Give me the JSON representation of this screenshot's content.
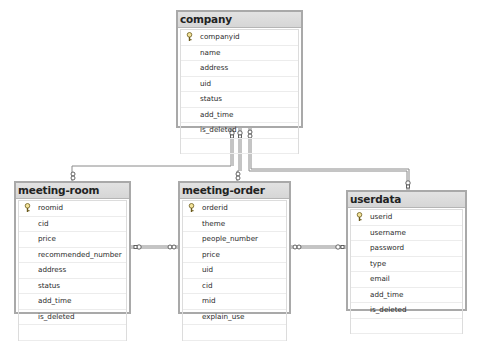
{
  "tables": {
    "company": {
      "name": "company",
      "columns": [
        "companyid",
        "name",
        "address",
        "uid",
        "status",
        "add_time",
        "is_deleted"
      ],
      "primary_key": "companyid"
    },
    "meeting_room": {
      "name": "meeting-room",
      "columns": [
        "roomid",
        "cid",
        "price",
        "recommended_number",
        "address",
        "status",
        "add_time",
        "is_deleted"
      ],
      "primary_key": "roomid"
    },
    "meeting_order": {
      "name": "meeting-order",
      "columns": [
        "orderid",
        "theme",
        "people_number",
        "price",
        "uid",
        "cid",
        "mid",
        "explain_use"
      ],
      "primary_key": "orderid"
    },
    "userdata": {
      "name": "userdata",
      "columns": [
        "userid",
        "username",
        "password",
        "type",
        "email",
        "add_time",
        "is_deleted"
      ],
      "primary_key": "userid"
    }
  },
  "relationships": [
    {
      "from": "company",
      "to": "meeting-room",
      "from_end": "key",
      "to_end": "infinity"
    },
    {
      "from": "company",
      "to": "meeting-order",
      "from_end": "key",
      "to_end": "infinity"
    },
    {
      "from": "company",
      "to": "userdata",
      "from_end": "infinity",
      "to_end": "key"
    },
    {
      "from": "meeting-room",
      "to": "meeting-order",
      "from_end": "key",
      "to_end": "infinity"
    },
    {
      "from": "meeting-order",
      "to": "userdata",
      "from_end": "infinity",
      "to_end": "key"
    }
  ],
  "colors": {
    "table_border": "#a9a9a9",
    "header_bg": "#d9d9d9",
    "line": "#8a8a8a"
  }
}
